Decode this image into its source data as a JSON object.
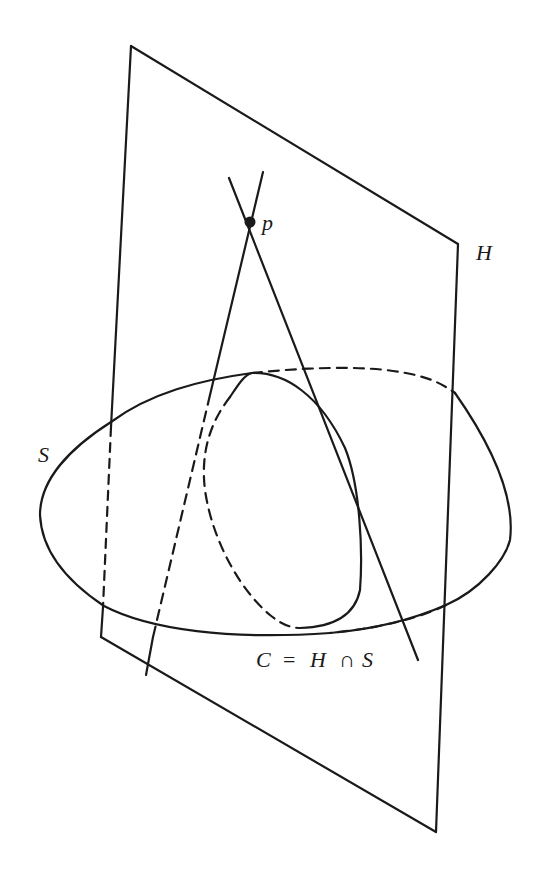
{
  "diagram": {
    "colors": {
      "stroke": "#1a1a1a",
      "background": "#ffffff"
    },
    "labels": {
      "point": "p",
      "plane": "H",
      "surface": "S",
      "curve_C": "C",
      "equals": "=",
      "curve_H": "H",
      "cap": "∩",
      "curve_S": "S"
    },
    "elements": [
      {
        "id": "plane-H",
        "type": "quadrilateral",
        "corners": [
          [
            131,
            46
          ],
          [
            458,
            244
          ],
          [
            436,
            832
          ],
          [
            101,
            637
          ]
        ]
      },
      {
        "id": "surface-S",
        "type": "ellipse-outline",
        "visible_part": "front (solid)",
        "hidden_part": "back (dashed)"
      },
      {
        "id": "curve-C",
        "type": "closed-curve",
        "visible_part": "solid",
        "hidden_part": "dashed"
      },
      {
        "id": "point-p",
        "type": "point",
        "position": [
          250,
          222
        ]
      },
      {
        "id": "tangent-line-1",
        "type": "line",
        "from": [
          263,
          172
        ],
        "to": [
          146,
          678
        ]
      },
      {
        "id": "tangent-line-2",
        "type": "line",
        "from": [
          229,
          178
        ],
        "to": [
          418,
          660
        ]
      }
    ]
  }
}
